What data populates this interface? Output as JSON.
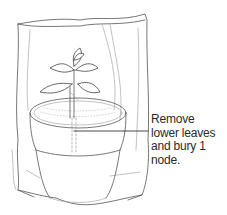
{
  "figure": {
    "annotation": {
      "lines": [
        "Remove",
        "lower leaves",
        "and bury 1",
        "node."
      ],
      "text": "Remove lower leaves and bury 1 node."
    },
    "colors": {
      "line": "#555555",
      "text": "#2a2a2a",
      "background": "#ffffff"
    }
  }
}
